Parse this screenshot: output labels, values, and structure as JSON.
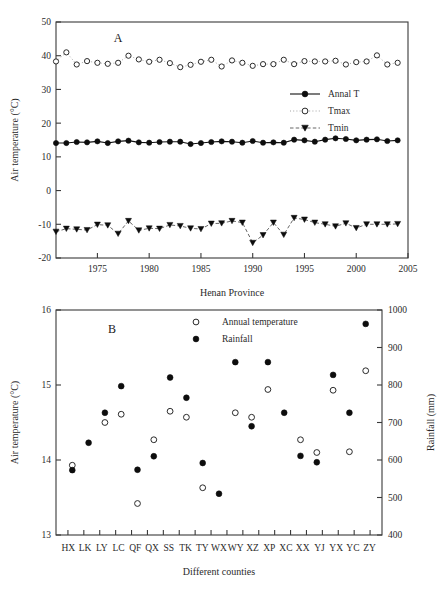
{
  "figure": {
    "panels": [
      "A",
      "B"
    ],
    "background": "#ffffff",
    "ink": "#2b2b2b"
  },
  "panelA": {
    "letter": "A",
    "ylabel": "Air temperature (°C)",
    "xlabel": "Henan Province",
    "legend": [
      {
        "label": "Annal T",
        "marker": "filled-circle",
        "line": "solid"
      },
      {
        "label": "Tmax",
        "marker": "open-circle",
        "line": "dotted"
      },
      {
        "label": "Tmin",
        "marker": "filled-triangle-down",
        "line": "dashed"
      }
    ],
    "yticks": [
      -20,
      -10,
      0,
      10,
      20,
      30,
      40,
      50
    ],
    "xticks": [
      1975,
      1980,
      1985,
      1990,
      1995,
      2000,
      2005
    ]
  },
  "panelB": {
    "letter": "B",
    "ylabel": "Air temperature (°C)",
    "y2label": "Rainfall (mm)",
    "xlabel": "Different counties",
    "legend": [
      {
        "label": "Annual temperature",
        "marker": "open-circle"
      },
      {
        "label": "Rainfall",
        "marker": "filled-circle"
      }
    ],
    "yticks": [
      13,
      14,
      15,
      16
    ],
    "y2ticks": [
      400,
      500,
      600,
      700,
      800,
      900,
      1000
    ]
  },
  "chart_data": [
    {
      "type": "line",
      "id": "panel-a",
      "title": "A",
      "xlabel": "Henan Province",
      "ylabel": "Air temperature (°C)",
      "xlim": [
        1971,
        2005
      ],
      "ylim": [
        -20,
        50
      ],
      "grid": false,
      "legend_position": "upper-right",
      "x": [
        1971,
        1972,
        1973,
        1974,
        1975,
        1976,
        1977,
        1978,
        1979,
        1980,
        1981,
        1982,
        1983,
        1984,
        1985,
        1986,
        1987,
        1988,
        1989,
        1990,
        1991,
        1992,
        1993,
        1994,
        1995,
        1996,
        1997,
        1998,
        1999,
        2000,
        2001,
        2002,
        2003,
        2004
      ],
      "series": [
        {
          "name": "Annal T",
          "marker": "filled-circle",
          "line": "solid",
          "values": [
            14.1,
            14.1,
            14.4,
            14.3,
            14.6,
            14.1,
            14.6,
            14.8,
            14.3,
            14.2,
            14.4,
            14.5,
            14.5,
            13.8,
            14.1,
            14.4,
            14.6,
            14.5,
            14.2,
            14.7,
            14.2,
            14.3,
            14.2,
            15.1,
            14.9,
            14.5,
            15.1,
            15.5,
            15.3,
            14.9,
            15.1,
            15.2,
            14.7,
            14.9
          ]
        },
        {
          "name": "Tmax",
          "marker": "open-circle",
          "line": "dotted",
          "values": [
            38.3,
            41.0,
            37.4,
            38.4,
            37.9,
            37.6,
            37.9,
            40.0,
            38.9,
            38.2,
            38.8,
            37.8,
            36.6,
            37.3,
            38.2,
            38.8,
            36.8,
            38.6,
            37.9,
            37.0,
            37.5,
            37.5,
            38.8,
            37.5,
            38.4,
            38.3,
            38.3,
            38.5,
            37.4,
            38.1,
            38.3,
            40.1,
            37.4,
            37.9
          ]
        },
        {
          "name": "Tmin",
          "marker": "filled-triangle-down",
          "line": "dashed",
          "values": [
            -12.2,
            -11.3,
            -11.5,
            -11.7,
            -10.1,
            -10.3,
            -12.8,
            -9.0,
            -11.8,
            -11.2,
            -11.3,
            -10.2,
            -10.5,
            -11.2,
            -11.4,
            -9.8,
            -9.7,
            -9.0,
            -9.5,
            -15.5,
            -13.2,
            -9.5,
            -13.1,
            -8.1,
            -8.6,
            -9.5,
            -10.0,
            -10.6,
            -9.7,
            -11.1,
            -10.0,
            -10.0,
            -10.0,
            -9.9
          ]
        }
      ]
    },
    {
      "type": "scatter",
      "id": "panel-b",
      "title": "B",
      "xlabel": "Different counties",
      "ylabel": "Air temperature (°C)",
      "y2label": "Rainfall (mm)",
      "ylim": [
        13,
        16
      ],
      "y2lim": [
        400,
        1000
      ],
      "grid": false,
      "legend_position": "upper-center",
      "categories": [
        "HX",
        "LK",
        "LY",
        "LC",
        "QF",
        "QX",
        "SS",
        "TK",
        "TY",
        "WX",
        "WY",
        "XZ",
        "XP",
        "XC",
        "XX",
        "YJ",
        "YX",
        "YC",
        "ZY"
      ],
      "series": [
        {
          "name": "Annual temperature",
          "marker": "open-circle",
          "axis": "left",
          "values": [
            13.93,
            null,
            14.5,
            14.61,
            13.42,
            14.27,
            14.65,
            14.57,
            13.63,
            null,
            14.63,
            14.57,
            14.94,
            null,
            14.27,
            14.1,
            14.93,
            14.11,
            15.19
          ]
        },
        {
          "name": "Rainfall",
          "marker": "filled-circle",
          "axis": "right",
          "values": [
            573,
            646,
            726,
            797,
            574,
            610,
            820,
            766,
            592,
            510,
            861,
            690,
            861,
            726,
            611,
            594,
            827,
            726,
            963
          ]
        }
      ]
    }
  ]
}
